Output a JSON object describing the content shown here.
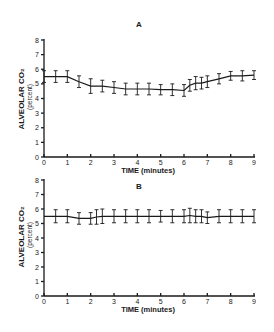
{
  "figure": {
    "panels": [
      {
        "title": "A",
        "xlabel": "TIME (minutes)",
        "ylabel": "ALVEOLAR CO₂",
        "ylabel_sub": "(percent)"
      },
      {
        "title": "B",
        "xlabel": "TIME (minutes)",
        "ylabel": "ALVEOLAR CO₂",
        "ylabel_sub": "(percent)"
      }
    ]
  },
  "chart_data": [
    {
      "type": "line",
      "title": "A",
      "xlabel": "TIME (minutes)",
      "ylabel": "ALVEOLAR CO₂ (percent)",
      "xlim": [
        0,
        9
      ],
      "ylim": [
        0,
        8
      ],
      "xticks": [
        0,
        1,
        2,
        3,
        4,
        5,
        6,
        7,
        8,
        9
      ],
      "yticks": [
        0,
        1,
        2,
        3,
        4,
        5,
        6,
        7,
        8
      ],
      "grid": false,
      "error_bars": true,
      "x": [
        0,
        0.5,
        1,
        1.5,
        2,
        2.5,
        3,
        3.5,
        4,
        4.5,
        5,
        5.5,
        6,
        6.25,
        6.5,
        6.75,
        7,
        7.5,
        8,
        8.5,
        9
      ],
      "series": [
        {
          "name": "Alveolar CO2",
          "values": [
            5.5,
            5.5,
            5.5,
            5.15,
            4.85,
            4.85,
            4.75,
            4.65,
            4.65,
            4.65,
            4.6,
            4.6,
            4.55,
            4.9,
            5.05,
            5.05,
            5.15,
            5.35,
            5.55,
            5.55,
            5.6
          ],
          "error": [
            0.4,
            0.4,
            0.4,
            0.4,
            0.5,
            0.4,
            0.4,
            0.4,
            0.4,
            0.4,
            0.35,
            0.4,
            0.4,
            0.4,
            0.45,
            0.4,
            0.4,
            0.35,
            0.3,
            0.35,
            0.3
          ]
        }
      ]
    },
    {
      "type": "line",
      "title": "B",
      "xlabel": "TIME (minutes)",
      "ylabel": "ALVEOLAR CO₂ (percent)",
      "xlim": [
        0,
        9
      ],
      "ylim": [
        0,
        8
      ],
      "xticks": [
        0,
        1,
        2,
        3,
        4,
        5,
        6,
        7,
        8,
        9
      ],
      "yticks": [
        0,
        1,
        2,
        3,
        4,
        5,
        6,
        7,
        8
      ],
      "grid": false,
      "error_bars": true,
      "x": [
        0,
        0.5,
        1,
        1.5,
        2,
        2.25,
        2.5,
        3,
        3.5,
        4,
        4.5,
        5,
        5.5,
        6,
        6.25,
        6.5,
        6.75,
        7,
        7.5,
        8,
        8.5,
        9
      ],
      "series": [
        {
          "name": "Alveolar CO2",
          "values": [
            5.5,
            5.5,
            5.5,
            5.35,
            5.35,
            5.45,
            5.5,
            5.5,
            5.5,
            5.5,
            5.5,
            5.5,
            5.5,
            5.5,
            5.55,
            5.5,
            5.5,
            5.4,
            5.5,
            5.5,
            5.5,
            5.5
          ],
          "error": [
            0.0,
            0.45,
            0.45,
            0.4,
            0.4,
            0.5,
            0.5,
            0.45,
            0.45,
            0.45,
            0.45,
            0.4,
            0.45,
            0.45,
            0.5,
            0.45,
            0.45,
            0.4,
            0.45,
            0.45,
            0.45,
            0.45
          ]
        }
      ]
    }
  ]
}
